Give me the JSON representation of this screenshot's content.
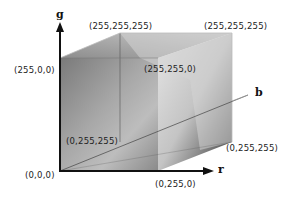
{
  "diagram": {
    "type": "rgb-color-cube",
    "axes": {
      "g": "g",
      "r": "r",
      "b": "b"
    },
    "vertex_labels": {
      "origin": "(0,0,0)",
      "top_left": "(255,0,0)",
      "back_top_left": "(255,255,255)",
      "back_top_right": "(255,255,255)",
      "front_top_right": "(255,255,0)",
      "inner_left": "(0,255,255)",
      "back_bottom_right": "(0,255,255)",
      "front_bottom_right": "(0,255,0)"
    }
  }
}
